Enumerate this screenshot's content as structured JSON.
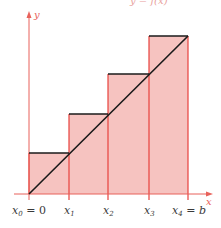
{
  "figure": {
    "type": "riemann-sum-upper-rectangles",
    "top_cutoff_text": "y = f(x)",
    "axes": {
      "x_label": "x",
      "y_label": "y"
    },
    "tick_labels": [
      {
        "base": "x",
        "sub": "0",
        "suffix": " = 0"
      },
      {
        "base": "x",
        "sub": "1",
        "suffix": ""
      },
      {
        "base": "x",
        "sub": "2",
        "suffix": ""
      },
      {
        "base": "x",
        "sub": "3",
        "suffix": ""
      },
      {
        "base": "x",
        "sub": "4",
        "suffix": " = b"
      }
    ],
    "rectangles": [
      {
        "left": "x0",
        "right": "x1",
        "height_px": 41
      },
      {
        "left": "x1",
        "right": "x2",
        "height_px": 80
      },
      {
        "left": "x2",
        "right": "x3",
        "height_px": 120
      },
      {
        "left": "x3",
        "right": "x4",
        "height_px": 158
      }
    ],
    "colors": {
      "rect_fill": "#f6c3c0",
      "rect_edge": "#e8413c",
      "axis": "#e8615a",
      "curve": "#1a1a1a",
      "top_edge": "#1a1a1a"
    }
  }
}
